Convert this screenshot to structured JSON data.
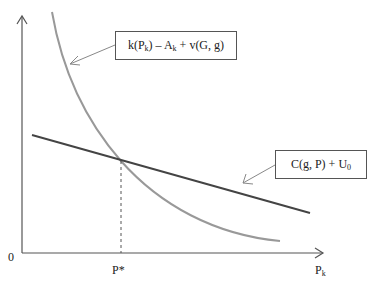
{
  "diagram": {
    "origin_label": "0",
    "x_axis_label_main": "P",
    "x_axis_label_sub": "k",
    "equilibrium_label": "P*",
    "curve_label": {
      "parts": [
        "k(P",
        "k",
        ") – A",
        "k",
        " + v(G, g)"
      ]
    },
    "line_label": {
      "parts": [
        "C(g, P) + U",
        "0"
      ]
    },
    "colors": {
      "axis": "#555555",
      "curve": "#999999",
      "line": "#444444",
      "dashed": "#555555",
      "box_border": "#555555"
    }
  }
}
